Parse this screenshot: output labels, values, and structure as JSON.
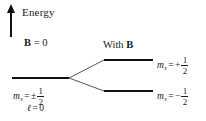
{
  "figure": {
    "type": "energy-level-diagram",
    "topic": "Zeeman splitting of an l = 0 level into two spin states",
    "width": 206,
    "height": 121,
    "background_color": "#ffffff",
    "line_color": "#101010"
  },
  "axis": {
    "label": "Energy",
    "direction": "up",
    "arrow_icon": "up-arrow-icon"
  },
  "columns": {
    "left": {
      "header_prefix": "B",
      "header_suffix": " = 0",
      "header_full": "B = 0"
    },
    "right": {
      "header_prefix": "With ",
      "header_bold": "B",
      "header_full": "With B"
    }
  },
  "levels": [
    {
      "id": "unsplit",
      "side": "left",
      "y": 77,
      "x": 12,
      "width": 57,
      "labels": [
        {
          "id": "ms",
          "var": "m",
          "sub": "s",
          "relation": "=",
          "sign": "±",
          "numerator": "1",
          "denominator": "2",
          "plain": "m_s = ±1/2"
        },
        {
          "id": "orbital",
          "var": "ℓ",
          "relation": "=",
          "value": "0",
          "plain": "ℓ = 0"
        }
      ]
    },
    {
      "id": "upper",
      "side": "right",
      "y": 59,
      "x": 104,
      "width": 49,
      "labels": [
        {
          "id": "ms-plus",
          "var": "m",
          "sub": "s",
          "relation": "=",
          "sign": "+",
          "numerator": "1",
          "denominator": "2",
          "plain": "m_s = +1/2"
        }
      ]
    },
    {
      "id": "lower",
      "side": "right",
      "y": 90,
      "x": 104,
      "width": 49,
      "labels": [
        {
          "id": "ms-minus",
          "var": "m",
          "sub": "s",
          "relation": "=",
          "sign": "−",
          "numerator": "1",
          "denominator": "2",
          "plain": "m_s = −1/2"
        }
      ]
    }
  ],
  "connectors": {
    "origin": {
      "x": 69,
      "y": 78
    },
    "targets": [
      {
        "x": 104,
        "y": 60
      },
      {
        "x": 104,
        "y": 91
      }
    ]
  },
  "text": {
    "energy": "Energy",
    "b_field_zero": "B",
    "b_field_zero_rest": " = 0",
    "with_b_prefix": "With ",
    "with_b_field": "B",
    "equals": "=",
    "plus_minus": "±",
    "plus": "+",
    "minus": "−",
    "m_var": "m",
    "s_sub": "s",
    "ell_var": "ℓ",
    "zero": "0",
    "one": "1",
    "two": "2"
  }
}
